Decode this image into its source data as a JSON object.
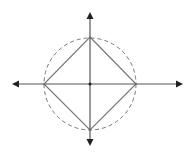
{
  "diagram": {
    "axes": {
      "color": "#555555",
      "arrowheads": [
        "left",
        "right",
        "up",
        "down"
      ]
    },
    "circle": {
      "style": "dashed",
      "color": "#777777"
    },
    "square": {
      "orientation": "diamond",
      "color": "#777777",
      "vertices_on": "axes"
    },
    "center_point": {
      "color": "#222222"
    }
  }
}
